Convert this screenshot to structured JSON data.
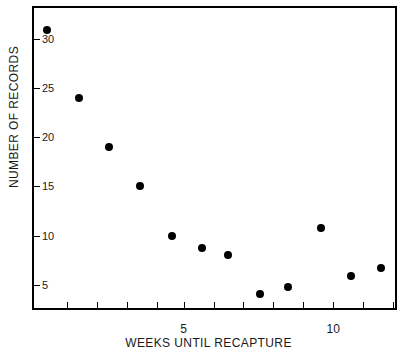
{
  "chart_data": {
    "type": "scatter",
    "title": "",
    "xlabel": "WEEKS UNTIL RECAPTURE",
    "ylabel": "NUMBER OF RECORDS",
    "xlim": [
      0,
      12.2
    ],
    "ylim": [
      2.2,
      33.2
    ],
    "grid": false,
    "legend": null,
    "marker": "filled-circle",
    "marker_color": "#000000",
    "x_ticks_major": [
      5,
      10
    ],
    "x_ticks_minor": [
      1.1,
      2.1,
      3.1,
      4.1,
      5,
      6,
      7,
      8,
      9,
      10,
      11,
      12
    ],
    "y_ticks": [
      5,
      10,
      15,
      20,
      25,
      30
    ],
    "x_tick_labels": [
      "5",
      "10"
    ],
    "y_tick_labels": [
      "5",
      "10",
      "15",
      "20",
      "25",
      "30"
    ],
    "points": [
      {
        "x": 0.45,
        "y": 31.0
      },
      {
        "x": 1.5,
        "y": 24.0
      },
      {
        "x": 2.5,
        "y": 19.0
      },
      {
        "x": 3.55,
        "y": 15.0
      },
      {
        "x": 4.6,
        "y": 10.0
      },
      {
        "x": 5.6,
        "y": 8.7
      },
      {
        "x": 6.5,
        "y": 8.0
      },
      {
        "x": 7.55,
        "y": 4.0
      },
      {
        "x": 8.5,
        "y": 4.7
      },
      {
        "x": 9.6,
        "y": 10.8
      },
      {
        "x": 10.6,
        "y": 5.9
      },
      {
        "x": 11.6,
        "y": 6.7
      }
    ]
  },
  "figure": {
    "background_color": "#ffffff",
    "axis_color": "#000000",
    "text_color": "#1a1a1a",
    "edge_artifact": ""
  }
}
